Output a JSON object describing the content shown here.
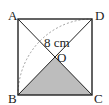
{
  "diagram": {
    "type": "geometry",
    "shape": "square",
    "vertices": {
      "A": "A",
      "B": "B",
      "C": "C",
      "D": "D",
      "O": "O"
    },
    "measure_label": "8 cm",
    "shaded_region": "triangle BOC",
    "colors": {
      "stroke": "#222222",
      "shade": "#bdbdbd",
      "arc": "#888888"
    }
  }
}
